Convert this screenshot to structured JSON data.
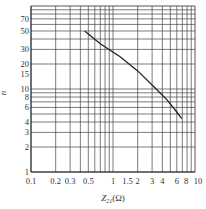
{
  "chart_data": {
    "type": "line",
    "title": "",
    "xlabel": "Z21 (Ω)",
    "xlabel_main": "Z",
    "xlabel_sub": "21",
    "xlabel_unit": "(Ω)",
    "ylabel": "n",
    "xscale": "log",
    "yscale": "log",
    "xlim": [
      0.1,
      10
    ],
    "ylim": [
      1,
      100
    ],
    "grid": true,
    "x_tick_labels": [
      "0.1",
      "0.2",
      "0.3",
      "0.5",
      "1",
      "1.5",
      "2",
      "3",
      "4",
      "6",
      "8",
      "10"
    ],
    "x_tick_values": [
      0.1,
      0.2,
      0.3,
      0.5,
      1,
      1.5,
      2,
      3,
      4,
      6,
      8,
      10
    ],
    "y_tick_labels": [
      "1",
      "2",
      "3",
      "4",
      "6",
      "8",
      "10",
      "15",
      "20",
      "30",
      "50",
      "70"
    ],
    "y_tick_values": [
      1,
      2,
      3,
      4,
      6,
      8,
      10,
      15,
      20,
      30,
      50,
      70
    ],
    "series": [
      {
        "name": "n vs Z21",
        "x": [
          0.45,
          0.7,
          1.22,
          2.0,
          3.2,
          4.5,
          5.8,
          6.9
        ],
        "y": [
          50,
          35,
          24.5,
          16.5,
          10.5,
          7.5,
          5.5,
          4.4
        ]
      }
    ]
  }
}
